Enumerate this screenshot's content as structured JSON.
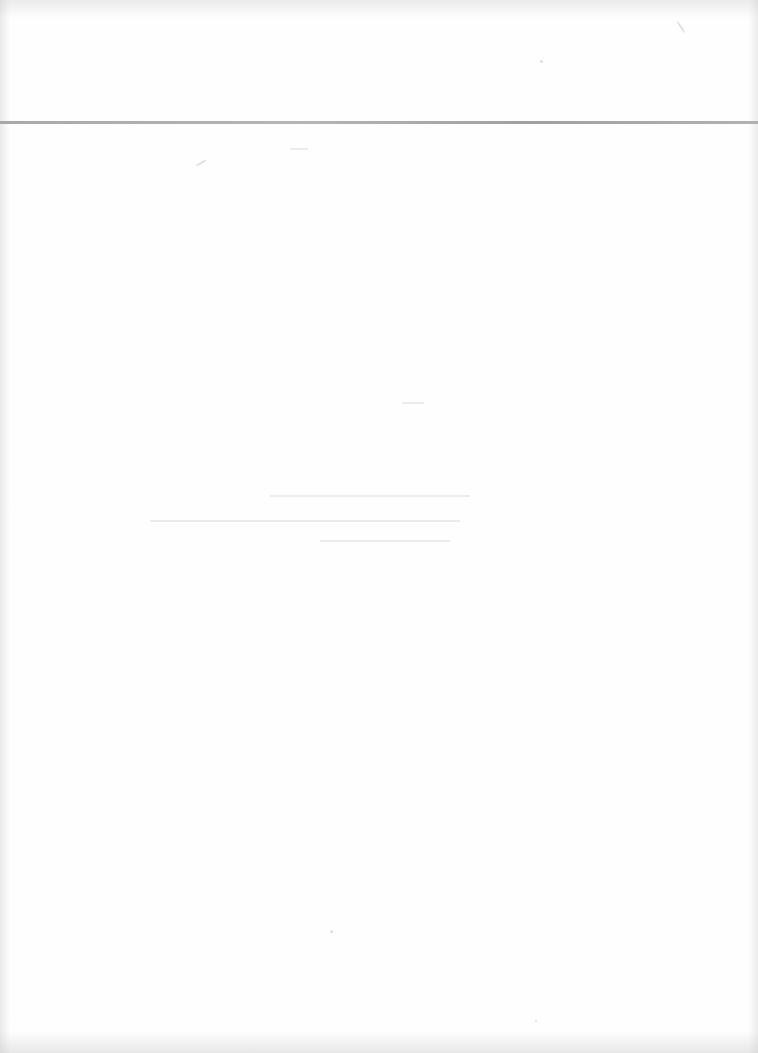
{
  "document": {
    "type": "scanned blank page",
    "header_rule": {
      "y": 122,
      "color": "#9a9a9a",
      "thickness": 3
    },
    "text": ""
  }
}
